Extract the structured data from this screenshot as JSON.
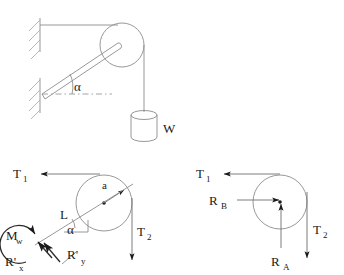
{
  "figure": {
    "panels": [
      {
        "id": "physical-setup",
        "name": "physical-setup",
        "labels": {
          "angle": "α",
          "weight": "W"
        },
        "parts": [
          "wall-support-upper",
          "wall-support-lower",
          "horizontal-cable",
          "inclined-beam",
          "pulley-wheel",
          "hanging-rope",
          "weight-cylinder",
          "angle-arc",
          "dashed-reference-line"
        ]
      },
      {
        "id": "fbd-beam",
        "name": "free-body-diagram-beam",
        "labels": {
          "tension1": "T",
          "tension1_sub": "1",
          "tension2": "T",
          "tension2_sub": "2",
          "radius": "a",
          "length": "L",
          "angle": "α",
          "moment": "M",
          "moment_sub": "w",
          "reaction_x": "R'",
          "reaction_x_sub": "x",
          "reaction_y": "R'",
          "reaction_y_sub": "y"
        }
      },
      {
        "id": "fbd-pulley",
        "name": "free-body-diagram-pulley",
        "labels": {
          "tension1": "T",
          "tension1_sub": "1",
          "tension2": "T",
          "tension2_sub": "2",
          "reaction_a": "R",
          "reaction_a_sub": "A",
          "reaction_b": "R",
          "reaction_b_sub": "B"
        }
      }
    ],
    "colors": {
      "background": "#ffffff",
      "line_light": "#8c8c8c",
      "line_hatch": "#b0b0b0",
      "line_force": "#6e6e6e",
      "line_dark": "#2b2b2b",
      "text": "#1a1a1a"
    }
  }
}
